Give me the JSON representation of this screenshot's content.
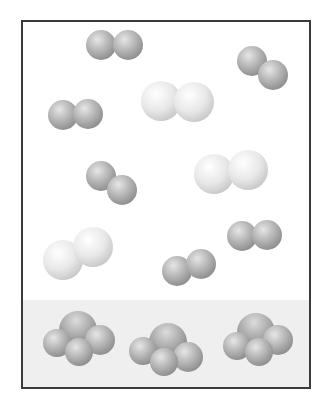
{
  "container": {
    "x": 22,
    "y": 21,
    "width": 288,
    "height": 367,
    "border_color": "#3a3a3a",
    "border_width": 2,
    "background": "#ffffff"
  },
  "liquid_phase": {
    "y_top": 300,
    "color": "#efefef"
  },
  "colors": {
    "dark_atom_light": "#e6e6e6",
    "dark_atom_mid": "#b4b4b4",
    "dark_atom_edge": "#8e8e8e",
    "light_atom_light": "#ffffff",
    "light_atom_mid": "#e8e8e8",
    "light_atom_edge": "#c9c9c9",
    "cluster_center_light": "#dcdcdc",
    "cluster_center_mid": "#a8a8a8",
    "cluster_center_edge": "#7a7a7a"
  },
  "gas_molecules": [
    {
      "type": "small-diatomic",
      "atoms": [
        {
          "cx": 101,
          "cy": 45,
          "r": 15
        },
        {
          "cx": 128,
          "cy": 45,
          "r": 15
        }
      ]
    },
    {
      "type": "small-diatomic",
      "atoms": [
        {
          "cx": 252,
          "cy": 61,
          "r": 15
        },
        {
          "cx": 273,
          "cy": 75,
          "r": 15
        }
      ]
    },
    {
      "type": "large-diatomic",
      "atoms": [
        {
          "cx": 161,
          "cy": 101,
          "r": 20
        },
        {
          "cx": 194,
          "cy": 102,
          "r": 20
        }
      ]
    },
    {
      "type": "small-diatomic",
      "atoms": [
        {
          "cx": 63,
          "cy": 115,
          "r": 15
        },
        {
          "cx": 88,
          "cy": 114,
          "r": 15
        }
      ]
    },
    {
      "type": "small-diatomic",
      "atoms": [
        {
          "cx": 101,
          "cy": 176,
          "r": 15
        },
        {
          "cx": 122,
          "cy": 190,
          "r": 15
        }
      ]
    },
    {
      "type": "large-diatomic",
      "atoms": [
        {
          "cx": 214,
          "cy": 174,
          "r": 20
        },
        {
          "cx": 248,
          "cy": 170,
          "r": 20
        }
      ]
    },
    {
      "type": "large-diatomic",
      "atoms": [
        {
          "cx": 63,
          "cy": 260,
          "r": 20
        },
        {
          "cx": 93,
          "cy": 247,
          "r": 20
        }
      ]
    },
    {
      "type": "small-diatomic",
      "atoms": [
        {
          "cx": 242,
          "cy": 236,
          "r": 15
        },
        {
          "cx": 267,
          "cy": 235,
          "r": 15
        }
      ]
    },
    {
      "type": "small-diatomic",
      "atoms": [
        {
          "cx": 177,
          "cy": 271,
          "r": 15
        },
        {
          "cx": 201,
          "cy": 264,
          "r": 15
        }
      ]
    }
  ],
  "liquid_molecules": [
    {
      "type": "tetra-cluster",
      "center": {
        "cx": 78,
        "cy": 330,
        "r": 19
      },
      "satellites": [
        {
          "cx": 57,
          "cy": 343,
          "r": 14
        },
        {
          "cx": 100,
          "cy": 340,
          "r": 15
        },
        {
          "cx": 79,
          "cy": 352,
          "r": 14
        }
      ]
    },
    {
      "type": "tetra-cluster",
      "center": {
        "cx": 168,
        "cy": 342,
        "r": 19
      },
      "satellites": [
        {
          "cx": 143,
          "cy": 351,
          "r": 14
        },
        {
          "cx": 188,
          "cy": 357,
          "r": 15
        },
        {
          "cx": 164,
          "cy": 362,
          "r": 14
        }
      ]
    },
    {
      "type": "tetra-cluster",
      "center": {
        "cx": 256,
        "cy": 332,
        "r": 19
      },
      "satellites": [
        {
          "cx": 237,
          "cy": 346,
          "r": 14
        },
        {
          "cx": 278,
          "cy": 340,
          "r": 15
        },
        {
          "cx": 259,
          "cy": 352,
          "r": 14
        }
      ]
    }
  ]
}
